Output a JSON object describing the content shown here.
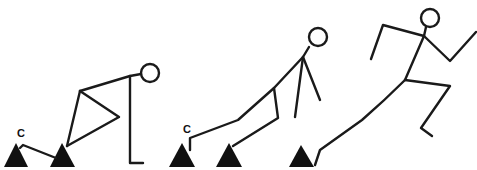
{
  "diagram": {
    "title": "",
    "colors": {
      "line": "#1a1a1a",
      "block": "#111111",
      "background": "#ffffff"
    },
    "labels": {
      "block_label_1": "C",
      "block_label_2": "C"
    },
    "phases": [
      {
        "name": "set-position"
      },
      {
        "name": "block-clearance"
      },
      {
        "name": "drive-phase"
      }
    ]
  }
}
